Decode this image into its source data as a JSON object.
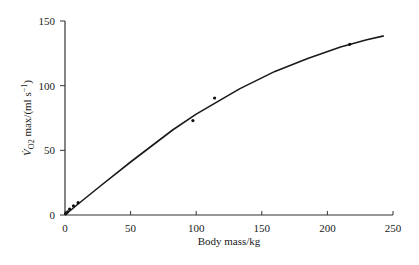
{
  "chart_data": {
    "type": "line",
    "title": "",
    "xlabel": "Body mass/kg",
    "ylabel": "V̇O2 max/(ml s⁻¹)",
    "ylabel_parts": {
      "main": "V̇",
      "sub": "O2",
      "rest": " max/(ml s",
      "sup": "−1",
      "close": ")"
    },
    "xlim": [
      0,
      250
    ],
    "ylim": [
      0,
      150
    ],
    "x_ticks": [
      0,
      50,
      100,
      150,
      200,
      250
    ],
    "y_ticks": [
      0,
      50,
      100,
      150
    ],
    "grid": false,
    "legend": null,
    "series": [
      {
        "name": "fitted curve",
        "style": "line",
        "x": [
          0,
          10,
          27,
          50,
          82,
          100,
          133,
          160,
          185,
          210,
          230,
          243
        ],
        "y": [
          0,
          8.5,
          22.4,
          41,
          65.7,
          78,
          97.5,
          111,
          121,
          130,
          135.5,
          138.5
        ]
      },
      {
        "name": "measured points",
        "style": "scatter",
        "x": [
          0.5,
          2,
          3.5,
          6.5,
          10,
          97.5,
          114,
          217
        ],
        "y": [
          1,
          2.5,
          4.5,
          7,
          9.5,
          73,
          90.5,
          132
        ]
      }
    ]
  }
}
